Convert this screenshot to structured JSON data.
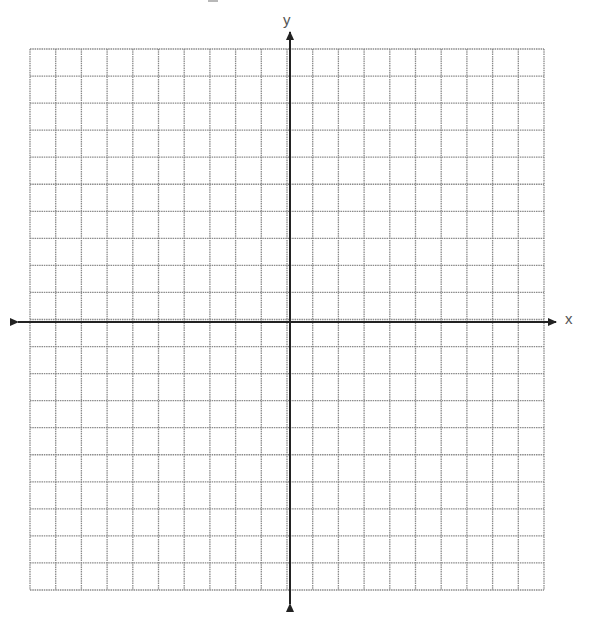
{
  "figure": {
    "type": "coordinate-grid",
    "grid": {
      "columns": 20,
      "rows": 20,
      "columns_left_of_y_axis": 10,
      "columns_right_of_y_axis": 10,
      "rows_above_x_axis": 10,
      "rows_below_x_axis": 10,
      "left": 30,
      "top": 49,
      "right": 544,
      "bottom": 590,
      "line_color": "#8a8a8a",
      "line_style": "dotted"
    },
    "axes": {
      "color": "#222222",
      "x_axis": {
        "label": "x",
        "y_position": 322,
        "from": 18,
        "to": 556,
        "arrows": "both"
      },
      "y_axis": {
        "label": "y",
        "x_position": 290,
        "from": 32,
        "to": 604,
        "arrows": "both"
      }
    },
    "tick_labels": [],
    "data_points": []
  }
}
